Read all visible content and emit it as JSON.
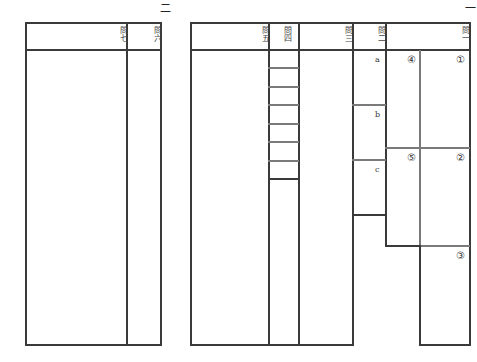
{
  "page_numbers": {
    "left": "二",
    "right": "一"
  },
  "left_panel": {
    "columns": [
      {
        "id": "q7",
        "header": "問七"
      },
      {
        "id": "q6",
        "header": "問六"
      }
    ]
  },
  "right_panel": {
    "columns": [
      {
        "id": "q5",
        "header": "問五"
      },
      {
        "id": "q4",
        "header": "問四"
      },
      {
        "id": "q3",
        "header": "問三"
      },
      {
        "id": "q2",
        "header": "問二",
        "sub_labels": [
          "a",
          "b",
          "c"
        ]
      },
      {
        "id": "q1",
        "header": "問一",
        "sub_labels": [
          "④",
          "①",
          "⑤",
          "②",
          "③"
        ]
      }
    ]
  }
}
